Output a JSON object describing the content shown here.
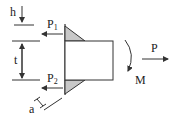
{
  "diagram": {
    "type": "engineering-weld-free-body-diagram",
    "labels": {
      "h": "h",
      "t": "t",
      "p1": "P",
      "p1_sub": "1",
      "p2": "P",
      "p2_sub": "2",
      "a": "a",
      "m": "M",
      "p": "P"
    },
    "colors": {
      "stroke": "#333333",
      "weld_fill": "#c8c8c8",
      "background": "#ffffff"
    }
  }
}
